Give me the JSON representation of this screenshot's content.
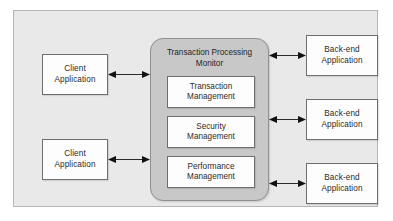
{
  "diagram": {
    "colors": {
      "panel_background": "#e9e9e9",
      "panel_border": "#b6b6b6",
      "node_fill": "#fdfdfd",
      "node_border": "#6e6e6e",
      "tpm_fill": "#c8c8c8",
      "tpm_border": "#8f8f8f",
      "arrow": "#2b2b2b",
      "text": "#2b2b2b"
    },
    "tpm": {
      "title_line1": "Transaction Processing",
      "title_line2": "Monitor",
      "services": [
        {
          "line1": "Transaction",
          "line2": "Management"
        },
        {
          "line1": "Security",
          "line2": "Management"
        },
        {
          "line1": "Performance",
          "line2": "Management"
        }
      ]
    },
    "clients": [
      {
        "line1": "Client",
        "line2": "Application"
      },
      {
        "line1": "Client",
        "line2": "Application"
      }
    ],
    "backends": [
      {
        "line1": "Back-end",
        "line2": "Application"
      },
      {
        "line1": "Back-end",
        "line2": "Application"
      },
      {
        "line1": "Back-end",
        "line2": "Application"
      }
    ],
    "connectors": [
      {
        "from": "client-application-1",
        "to": "transaction-processing-monitor",
        "style": "double-headed-arrow"
      },
      {
        "from": "client-application-2",
        "to": "transaction-processing-monitor",
        "style": "double-headed-arrow"
      },
      {
        "from": "transaction-processing-monitor",
        "to": "back-end-application-1",
        "style": "double-headed-arrow"
      },
      {
        "from": "transaction-processing-monitor",
        "to": "back-end-application-2",
        "style": "double-headed-arrow"
      },
      {
        "from": "transaction-processing-monitor",
        "to": "back-end-application-3",
        "style": "double-headed-arrow"
      }
    ]
  }
}
